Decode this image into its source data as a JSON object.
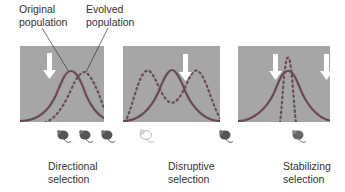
{
  "labels": {
    "original_population": [
      "Original",
      "population"
    ],
    "evolved_population": [
      "Evolved",
      "population"
    ]
  },
  "panels": [
    {
      "name": "directional",
      "caption": [
        "Directional",
        "selection"
      ],
      "arrows": 1,
      "mice": [
        "dark",
        "dark",
        "dark"
      ]
    },
    {
      "name": "disruptive",
      "caption": [
        "Disruptive",
        "selection"
      ],
      "arrows": 1,
      "mice": [
        "light",
        "dark"
      ]
    },
    {
      "name": "stabilizing",
      "caption": [
        "Stabilizing",
        "selection"
      ],
      "arrows": 2,
      "mice": [
        "dark"
      ]
    }
  ],
  "legend": {
    "original_curve": "solid",
    "evolved_curve": "dotted"
  },
  "colors": {
    "panel_bg": "#a6a6a6",
    "original_curve": "#6b4a57",
    "evolved_curve": "#6b4a57",
    "arrow": "#ffffff"
  }
}
